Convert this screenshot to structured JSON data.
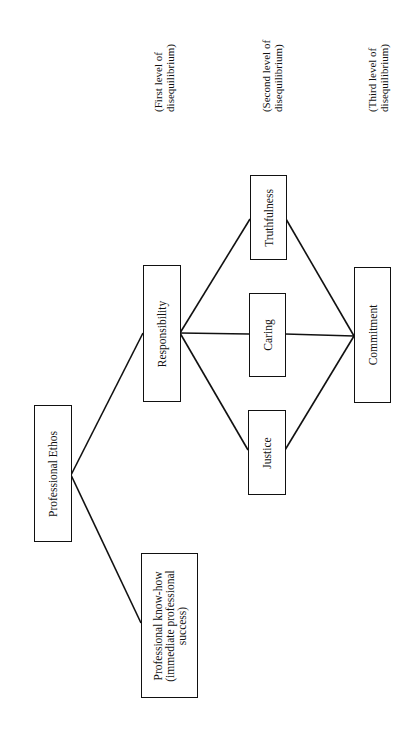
{
  "diagram": {
    "orientation": "rotated -90deg (page landscape)",
    "nodes": {
      "ethos": {
        "label": "Professional Ethos"
      },
      "knowhow": {
        "line1": "Professional know-how",
        "line2": "(immediate professional",
        "line3": "success)"
      },
      "responsibility": {
        "label": "Responsibility"
      },
      "truthfulness": {
        "label": "Truthfulness"
      },
      "caring": {
        "label": "Caring"
      },
      "justice": {
        "label": "Justice"
      },
      "commitment": {
        "label": "Commitment"
      }
    },
    "levels": [
      {
        "line1": "(First level of",
        "line2": "disequilibrium)"
      },
      {
        "line1": "(Second level of",
        "line2": "disequilibrium)"
      },
      {
        "line1": "(Third level of",
        "line2": "disequilibrium)"
      }
    ],
    "edges": [
      [
        "Professional Ethos",
        "Responsibility"
      ],
      [
        "Professional Ethos",
        "Professional know-how"
      ],
      [
        "Responsibility",
        "Truthfulness"
      ],
      [
        "Responsibility",
        "Caring"
      ],
      [
        "Responsibility",
        "Justice"
      ],
      [
        "Truthfulness",
        "Commitment"
      ],
      [
        "Caring",
        "Commitment"
      ],
      [
        "Justice",
        "Commitment"
      ]
    ],
    "colors": {
      "line": "#111111",
      "background": "#ffffff"
    }
  }
}
